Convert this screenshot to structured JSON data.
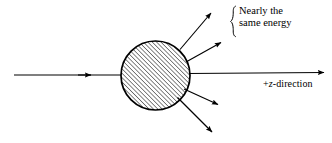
{
  "figure": {
    "background_color": "#ffffff",
    "stroke_color": "#000000",
    "width": 332,
    "height": 143
  },
  "annotations": {
    "bracket_label": {
      "name": "nearly-same-energy-label",
      "line1": "Nearly the",
      "line2": "same energy"
    },
    "axis_label": {
      "name": "z-direction-label",
      "prefix": "+",
      "variable": "z",
      "suffix": "-direction"
    }
  },
  "diagram": {
    "target": {
      "name": "hatched-circle-target",
      "center_x": 155.5,
      "center_y": 75.5,
      "radius": 34.5,
      "fill": "hatch-45",
      "hatch_spacing": 3.1,
      "hatch_angle_deg": 45,
      "stroke_width": 1.6
    },
    "incident_beam": {
      "name": "incident-beam-arrow",
      "x1": 14,
      "y1": 75,
      "x2": 121,
      "y2": 75,
      "arrowhead_at": [
        90,
        75
      ]
    },
    "forward_axis": {
      "name": "forward-axis-arrow",
      "x1": 190,
      "y1": 74,
      "x2": 325,
      "y2": 73
    },
    "scattered_rays": [
      {
        "name": "scattered-ray-up-outer",
        "x1": 180,
        "y1": 49,
        "x2": 212,
        "y2": 12
      },
      {
        "name": "scattered-ray-up-inner",
        "x1": 186,
        "y1": 62,
        "x2": 222,
        "y2": 42
      },
      {
        "name": "scattered-ray-down-inner",
        "x1": 184,
        "y1": 89,
        "x2": 219,
        "y2": 105
      },
      {
        "name": "scattered-ray-down-outer",
        "x1": 177,
        "y1": 98,
        "x2": 213,
        "y2": 133
      }
    ],
    "bracket": {
      "name": "curly-brace",
      "x": 233,
      "y_top": 6,
      "y_bottom": 37
    }
  }
}
